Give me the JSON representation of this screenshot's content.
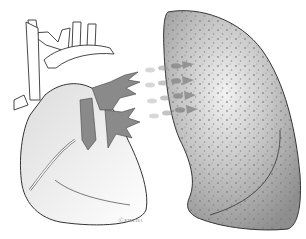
{
  "figure": {
    "artist_signature": "Ⓒ KINEHA",
    "colors": {
      "outline": "#3a3a3a",
      "vein_fill": "#8a8a8a",
      "lung_fill": "#9a9a9a",
      "lung_highlight": "#e6e6e6",
      "dot": "#7a7a7a",
      "arrow": "#8c8c8c",
      "background": "#ffffff"
    },
    "arrows": [
      {
        "x1": 146,
        "y1": 70,
        "x2": 196,
        "y2": 62
      },
      {
        "x1": 146,
        "y1": 84,
        "x2": 196,
        "y2": 78
      },
      {
        "x1": 148,
        "y1": 100,
        "x2": 196,
        "y2": 94
      },
      {
        "x1": 150,
        "y1": 116,
        "x2": 196,
        "y2": 108
      }
    ]
  }
}
